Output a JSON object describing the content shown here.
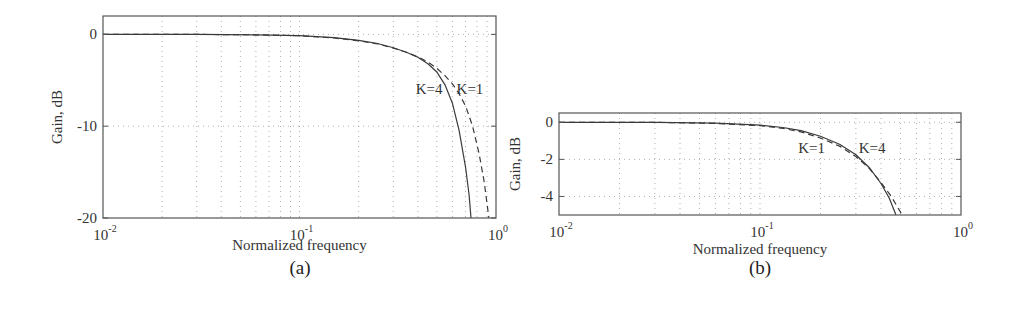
{
  "chart_data": [
    {
      "id": "a",
      "type": "line",
      "caption": "(a)",
      "title": "",
      "xlabel": "Normalized frequency",
      "ylabel": "Gain, dB",
      "xscale": "log",
      "xlim": [
        0.01,
        1
      ],
      "ylim": [
        -20,
        2
      ],
      "xticks": [
        0.01,
        0.1,
        1
      ],
      "xtick_labels": [
        {
          "base": "10",
          "exp": "-2"
        },
        {
          "base": "10",
          "exp": "-1"
        },
        {
          "base": "10",
          "exp": "0"
        }
      ],
      "yticks": [
        0,
        -10,
        -20
      ],
      "ytick_labels": [
        "0",
        "-10",
        "-20"
      ],
      "grid": true,
      "legend": null,
      "annotations": [
        {
          "text": "K=4",
          "x": 0.39,
          "y": -6.5
        },
        {
          "text": "K=1",
          "x": 0.63,
          "y": -6.5
        }
      ],
      "series": [
        {
          "name": "K=4",
          "style": "solid",
          "x": [
            0.01,
            0.03,
            0.06,
            0.1,
            0.15,
            0.2,
            0.25,
            0.3,
            0.35,
            0.4,
            0.45,
            0.5,
            0.55,
            0.6,
            0.65,
            0.7,
            0.73,
            0.746
          ],
          "y": [
            0,
            0,
            -0.05,
            -0.15,
            -0.35,
            -0.65,
            -1.0,
            -1.45,
            -1.95,
            -2.5,
            -3.2,
            -4.1,
            -5.5,
            -7.5,
            -10.5,
            -14.5,
            -17.5,
            -20
          ]
        },
        {
          "name": "K=1",
          "style": "dashed",
          "x": [
            0.01,
            0.03,
            0.06,
            0.1,
            0.15,
            0.2,
            0.25,
            0.3,
            0.35,
            0.4,
            0.45,
            0.5,
            0.55,
            0.6,
            0.65,
            0.7,
            0.76,
            0.82,
            0.87,
            0.92
          ],
          "y": [
            0,
            0,
            -0.05,
            -0.15,
            -0.4,
            -0.7,
            -1.05,
            -1.5,
            -1.95,
            -2.45,
            -3.0,
            -3.7,
            -4.5,
            -5.4,
            -6.5,
            -7.8,
            -10.0,
            -13.0,
            -16.0,
            -20
          ]
        }
      ]
    },
    {
      "id": "b",
      "type": "line",
      "caption": "(b)",
      "title": "",
      "xlabel": "Normalized frequency",
      "ylabel": "Gain, dB",
      "xscale": "log",
      "xlim": [
        0.01,
        1
      ],
      "ylim": [
        -5,
        0.5
      ],
      "xticks": [
        0.01,
        0.1,
        1
      ],
      "xtick_labels": [
        {
          "base": "10",
          "exp": "-2"
        },
        {
          "base": "10",
          "exp": "-1"
        },
        {
          "base": "10",
          "exp": "0"
        }
      ],
      "yticks": [
        0,
        -2,
        -4
      ],
      "ytick_labels": [
        "0",
        "-2",
        "-4"
      ],
      "grid": true,
      "legend": null,
      "annotations": [
        {
          "text": "K=1",
          "x": 0.155,
          "y": -1.65
        },
        {
          "text": "K=4",
          "x": 0.31,
          "y": -1.65
        }
      ],
      "series": [
        {
          "name": "K=4",
          "style": "solid",
          "x": [
            0.01,
            0.03,
            0.06,
            0.1,
            0.13,
            0.16,
            0.2,
            0.25,
            0.3,
            0.35,
            0.4,
            0.44,
            0.475
          ],
          "y": [
            0,
            0,
            -0.05,
            -0.15,
            -0.28,
            -0.45,
            -0.75,
            -1.2,
            -1.75,
            -2.45,
            -3.3,
            -4.1,
            -5.0
          ]
        },
        {
          "name": "K=1",
          "style": "dashed",
          "x": [
            0.01,
            0.03,
            0.06,
            0.1,
            0.13,
            0.16,
            0.2,
            0.25,
            0.3,
            0.35,
            0.4,
            0.45,
            0.51
          ],
          "y": [
            0,
            0,
            -0.06,
            -0.18,
            -0.33,
            -0.52,
            -0.85,
            -1.3,
            -1.85,
            -2.5,
            -3.25,
            -4.0,
            -5.0
          ]
        }
      ]
    }
  ]
}
